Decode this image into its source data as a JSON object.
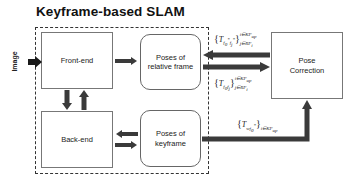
{
  "title": "Keyframe-based SLAM",
  "input_label": "Image",
  "nodes": {
    "front_end": "Front-end",
    "back_end": "Back-end",
    "poses_relative": [
      "Poses of",
      "relative frame"
    ],
    "poses_keyframe": [
      "Poses of",
      "keyframe"
    ],
    "pose_correction": [
      "Pose",
      "Correction"
    ]
  },
  "edge_labels": {
    "correction_to_relative": {
      "base": "T",
      "subscript": "f0* fj*",
      "superscript": "i∈KF_up",
      "outer_subscript": "j∈RF_i"
    },
    "relative_to_correction": {
      "base": "T",
      "subscript": "f0 fj",
      "superscript": "i∈KF_up",
      "outer_subscript": "j∈RF_i"
    },
    "keyframe_to_correction": {
      "base": "T",
      "subscript": "w f0*",
      "outer_subscript": "i∈KF_up"
    }
  },
  "colors": {
    "arrow": "#3a3a3a",
    "border": "#777777",
    "dashed": "#333333",
    "text": "#222222"
  }
}
